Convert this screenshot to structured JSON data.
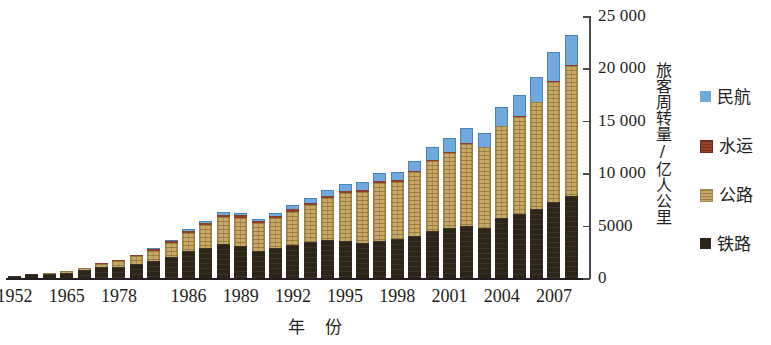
{
  "chart_data": {
    "type": "bar",
    "stacked": true,
    "title": "",
    "xlabel": "年  份",
    "ylabel": "旅客周转量/亿人公里",
    "ylim": [
      0,
      25000
    ],
    "yticks": [
      0,
      5000,
      10000,
      15000,
      20000,
      25000
    ],
    "ytick_labels": [
      "0",
      "5000",
      "10 000",
      "15 000",
      "20 000",
      "25 000"
    ],
    "y_axis_position": "right",
    "grid": false,
    "legend_position": "right",
    "categories": [
      "1952",
      "1957",
      "1962",
      "1965",
      "1970",
      "1975",
      "1978",
      "1980",
      "1982",
      "1984",
      "1986",
      "1987",
      "1988",
      "1989",
      "1990",
      "1991",
      "1992",
      "1993",
      "1994",
      "1995",
      "1996",
      "1997",
      "1998",
      "1999",
      "2000",
      "2001",
      "2002",
      "2003",
      "2004",
      "2005",
      "2006",
      "2007",
      "2008"
    ],
    "xtick_labels": [
      "1952",
      "1965",
      "1978",
      "1986",
      "1989",
      "1992",
      "1995",
      "1998",
      "2001",
      "2004",
      "2007"
    ],
    "series": [
      {
        "name": "铁路",
        "color": "#2e2519",
        "values": [
          200,
          340,
          380,
          480,
          720,
          1018,
          1093,
          1383,
          1577,
          2040,
          2588,
          2843,
          3261,
          3074,
          2613,
          2825,
          3152,
          3483,
          3635,
          3546,
          3325,
          3542,
          3682,
          4053,
          4533,
          4767,
          4969,
          4788,
          5712,
          6062,
          6622,
          7216,
          7779
        ]
      },
      {
        "name": "公路",
        "color": "#c8a866",
        "values": [
          23,
          70,
          120,
          150,
          220,
          340,
          521,
          730,
          1008,
          1340,
          1745,
          2188,
          2526,
          2699,
          2620,
          2871,
          3194,
          3502,
          4008,
          4603,
          4909,
          5541,
          5516,
          6063,
          6657,
          7207,
          7806,
          7696,
          8748,
          9292,
          10131,
          11506,
          12476
        ]
      },
      {
        "name": "水运",
        "color": "#8d3f2b",
        "values": [
          12,
          25,
          35,
          40,
          55,
          78,
          101,
          129,
          152,
          164,
          178,
          200,
          215,
          199,
          165,
          176,
          200,
          183,
          183,
          171,
          162,
          155,
          120,
          100,
          101,
          90,
          80,
          63,
          66,
          68,
          74,
          77,
          59
        ]
      },
      {
        "name": "民航",
        "color": "#6fa9dd",
        "values": [
          2,
          5,
          8,
          10,
          18,
          34,
          28,
          40,
          60,
          100,
          180,
          230,
          290,
          263,
          230,
          290,
          403,
          469,
          551,
          681,
          748,
          773,
          833,
          971,
          1211,
          1265,
          1455,
          1265,
          1830,
          2045,
          2371,
          2792,
          2883
        ]
      }
    ]
  },
  "axes": {
    "y_title": "旅客周转量/亿人公里",
    "x_title": "年  份"
  },
  "legend": {
    "items": [
      {
        "label": "民航",
        "swatch": "legend-swatch-air",
        "color": "#6fa9dd"
      },
      {
        "label": "水运",
        "swatch": "legend-swatch-water",
        "color": "#8d3f2b"
      },
      {
        "label": "公路",
        "swatch": "legend-swatch-road",
        "color": "#c8a866"
      },
      {
        "label": "铁路",
        "swatch": "legend-swatch-rail",
        "color": "#2e2519"
      }
    ]
  }
}
